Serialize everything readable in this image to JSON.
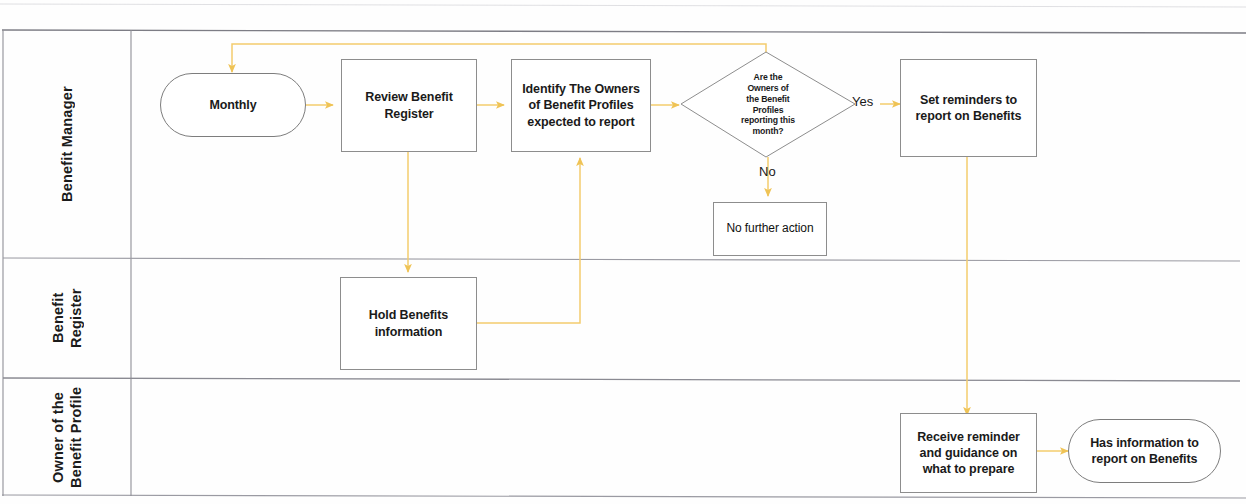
{
  "diagram": {
    "style": {
      "lane_border_color": "#8f8f96",
      "node_border_color": "#8d8d8d",
      "arrow_color": "#f2c75c",
      "text_color": "#1a1a1a",
      "background": "#ffffff"
    },
    "lanes": [
      {
        "id": "lane-benefit-manager",
        "label": "Benefit Manager"
      },
      {
        "id": "lane-benefit-register",
        "label": "Benefit\nRegister"
      },
      {
        "id": "lane-profile-owner",
        "label": "Owner of the\nBenefit Profile"
      }
    ],
    "nodes": [
      {
        "id": "monthly",
        "lane": "lane-benefit-manager",
        "type": "terminator",
        "label": "Monthly"
      },
      {
        "id": "review-benefit-register",
        "lane": "lane-benefit-manager",
        "type": "process",
        "label": "Review Benefit\nRegister"
      },
      {
        "id": "identify-owners",
        "lane": "lane-benefit-manager",
        "type": "process",
        "label": "Identify The Owners\nof Benefit Profiles\nexpected to report"
      },
      {
        "id": "owners-reporting-decision",
        "lane": "lane-benefit-manager",
        "type": "decision",
        "label": "Are the\nOwners of\nthe Benefit\nProfiles\nreporting this\nmonth?"
      },
      {
        "id": "set-reminders",
        "lane": "lane-benefit-manager",
        "type": "process",
        "label": "Set reminders to\nreport on Benefits"
      },
      {
        "id": "no-further-action",
        "lane": "lane-benefit-manager",
        "type": "process",
        "label": "No further action"
      },
      {
        "id": "hold-benefits-information",
        "lane": "lane-benefit-register",
        "type": "process",
        "label": "Hold Benefits\ninformation"
      },
      {
        "id": "receive-reminder",
        "lane": "lane-profile-owner",
        "type": "process",
        "label": "Receive reminder\nand guidance on\nwhat to prepare"
      },
      {
        "id": "has-information",
        "lane": "lane-profile-owner",
        "type": "terminator",
        "label": "Has information to\nreport on Benefits"
      }
    ],
    "edges": [
      {
        "id": "edge-monthly-review",
        "from": "monthly",
        "to": "review-benefit-register",
        "label": ""
      },
      {
        "id": "edge-review-identify",
        "from": "review-benefit-register",
        "to": "identify-owners",
        "label": ""
      },
      {
        "id": "edge-identify-decision",
        "from": "identify-owners",
        "to": "owners-reporting-decision",
        "label": ""
      },
      {
        "id": "edge-decision-yes",
        "from": "owners-reporting-decision",
        "to": "set-reminders",
        "label": "Yes"
      },
      {
        "id": "edge-decision-no",
        "from": "owners-reporting-decision",
        "to": "no-further-action",
        "label": "No"
      },
      {
        "id": "edge-decision-monthly-loop",
        "from": "owners-reporting-decision",
        "to": "monthly",
        "label": ""
      },
      {
        "id": "edge-review-hold",
        "from": "review-benefit-register",
        "to": "hold-benefits-information",
        "label": ""
      },
      {
        "id": "edge-hold-identify",
        "from": "hold-benefits-information",
        "to": "identify-owners",
        "label": ""
      },
      {
        "id": "edge-reminders-receive",
        "from": "set-reminders",
        "to": "receive-reminder",
        "label": ""
      },
      {
        "id": "edge-receive-has-info",
        "from": "receive-reminder",
        "to": "has-information",
        "label": ""
      }
    ],
    "edge_labels": {
      "yes": "Yes",
      "no": "No"
    }
  }
}
